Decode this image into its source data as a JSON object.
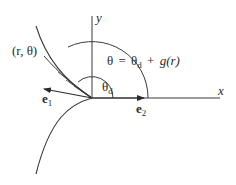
{
  "diagram": {
    "axes": {
      "x_label": "x",
      "y_label": "y"
    },
    "point_label": "(r, θ)",
    "equation": {
      "lhs": "θ",
      "eq": "=",
      "theta_d": "θ",
      "theta_d_sub": "d",
      "plus": "+",
      "g": "g",
      "arg": "(r)"
    },
    "angle_label": {
      "theta": "θ",
      "sub": "d"
    },
    "vectors": {
      "e1": "e",
      "e1_sub": "1",
      "e2": "e",
      "e2_sub": "2"
    },
    "colors": {
      "stroke": "#3a3a3a",
      "text": "#2a2a2a",
      "background": "#ffffff"
    }
  }
}
